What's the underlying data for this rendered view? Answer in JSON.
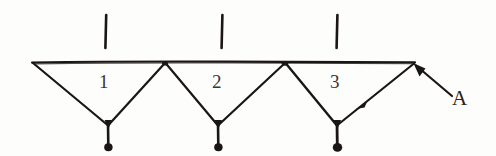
{
  "figure": {
    "kind": "hand-drawn-truss-sketch",
    "ink_color": "#1a1613",
    "background_color": "#fdfdfc",
    "top_chord": {
      "name": "top-chord-line",
      "y": 62,
      "x_start": 32,
      "x_end": 415
    },
    "top_nodes": [
      {
        "id": "T0",
        "x": 32,
        "y": 62
      },
      {
        "id": "T1",
        "x": 165,
        "y": 62
      },
      {
        "id": "T2",
        "x": 285,
        "y": 62
      },
      {
        "id": "T3",
        "x": 415,
        "y": 62
      }
    ],
    "bottom_nodes": [
      {
        "id": "B1",
        "x": 108,
        "y": 125
      },
      {
        "id": "B2",
        "x": 218,
        "y": 125
      },
      {
        "id": "B3",
        "x": 337,
        "y": 125
      }
    ],
    "diagonals": [
      {
        "from": "T0",
        "to": "B1"
      },
      {
        "from": "B1",
        "to": "T1"
      },
      {
        "from": "T1",
        "to": "B2"
      },
      {
        "from": "B2",
        "to": "T2"
      },
      {
        "from": "T2",
        "to": "B3"
      },
      {
        "from": "B3",
        "to": "T3"
      }
    ],
    "load_ticks": [
      {
        "name": "load-tick-1",
        "x": 106,
        "y_top": 15,
        "y_bottom": 48
      },
      {
        "name": "load-tick-2",
        "x": 222,
        "y_top": 15,
        "y_bottom": 48
      },
      {
        "name": "load-tick-3",
        "x": 337,
        "y_top": 15,
        "y_bottom": 48
      }
    ],
    "hangers": [
      {
        "name": "hanger-1",
        "x": 108,
        "y_top": 125,
        "y_bottom": 146,
        "dot_r": 4.2
      },
      {
        "name": "hanger-2",
        "x": 218,
        "y_top": 125,
        "y_bottom": 146,
        "dot_r": 4.2
      },
      {
        "name": "hanger-3",
        "x": 337,
        "y_top": 125,
        "y_bottom": 147,
        "dot_r": 4.6
      }
    ],
    "pointer": {
      "name": "pointer-arrow-a",
      "tail_x": 455,
      "tail_y": 98,
      "head_x": 414,
      "head_y": 64
    }
  },
  "labels": {
    "bays": [
      {
        "name": "bay-label-1",
        "text": "1",
        "x": 99,
        "y": 72
      },
      {
        "name": "bay-label-2",
        "text": "2",
        "x": 212,
        "y": 72
      },
      {
        "name": "bay-label-3",
        "text": "3",
        "x": 330,
        "y": 72
      }
    ],
    "points": [
      {
        "name": "point-label-a",
        "text": "A",
        "x": 452,
        "y": 88
      }
    ]
  }
}
